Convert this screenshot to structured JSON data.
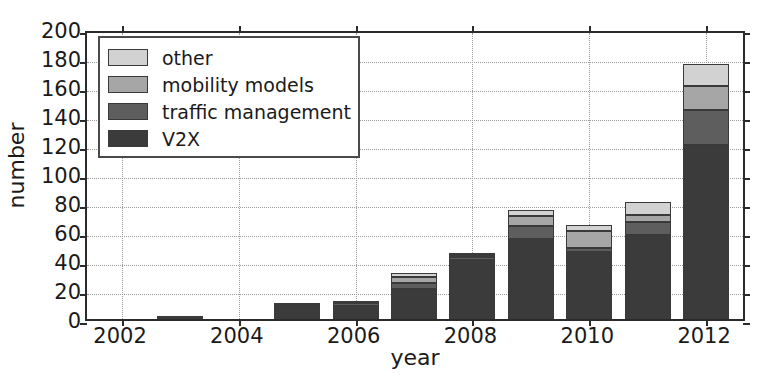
{
  "chart_data": {
    "type": "bar",
    "subtype": "stacked",
    "title": "",
    "xlabel": "year",
    "ylabel": "number",
    "x": [
      2002,
      2003,
      2004,
      2005,
      2006,
      2007,
      2008,
      2009,
      2010,
      2011,
      2012
    ],
    "categories": [
      "2002",
      "2003",
      "2004",
      "2005",
      "2006",
      "2007",
      "2008",
      "2009",
      "2010",
      "2011",
      "2012"
    ],
    "xtick_labels": [
      "2002",
      "2004",
      "2006",
      "2008",
      "2010",
      "2012"
    ],
    "xticks": [
      2002,
      2004,
      2006,
      2008,
      2010,
      2012
    ],
    "ytick_labels": [
      "0",
      "20",
      "40",
      "60",
      "80",
      "100",
      "120",
      "140",
      "160",
      "180",
      "200"
    ],
    "yticks": [
      0,
      20,
      40,
      60,
      80,
      100,
      120,
      140,
      160,
      180,
      200
    ],
    "ylim": [
      0,
      200
    ],
    "xlim": [
      2001.4,
      2012.7
    ],
    "grid": true,
    "grid_style": "dotted",
    "legend_position": "upper left",
    "stack_order_bottom_to_top": [
      "V2X",
      "traffic management",
      "mobility models",
      "other"
    ],
    "series": [
      {
        "name": "V2X",
        "color": "#3b3b3b",
        "values": [
          0,
          2,
          0,
          8,
          9,
          21,
          41,
          55,
          46,
          58,
          120
        ]
      },
      {
        "name": "traffic management",
        "color": "#5e5e5e",
        "values": [
          0,
          0,
          0,
          2,
          2,
          4,
          2,
          9,
          3,
          9,
          24
        ]
      },
      {
        "name": "mobility models",
        "color": "#a6a6a6",
        "values": [
          0,
          0,
          0,
          1,
          1,
          4,
          1,
          7,
          12,
          5,
          17
        ]
      },
      {
        "name": "other",
        "color": "#d2d2d2",
        "values": [
          0,
          0,
          0,
          0,
          0,
          3,
          1,
          4,
          4,
          9,
          15
        ]
      }
    ],
    "totals": [
      0,
      2,
      0,
      11,
      12,
      32,
      45,
      75,
      65,
      81,
      176
    ]
  },
  "legend": {
    "entries": [
      {
        "label": "other",
        "color": "#d2d2d2"
      },
      {
        "label": "mobility models",
        "color": "#a6a6a6"
      },
      {
        "label": "traffic management",
        "color": "#5e5e5e"
      },
      {
        "label": "V2X",
        "color": "#3b3b3b"
      }
    ]
  },
  "colors": {
    "axis": "#2b2b2b",
    "grid": "#9a9a9a",
    "text": "#1a1a1a",
    "background": "#ffffff"
  }
}
